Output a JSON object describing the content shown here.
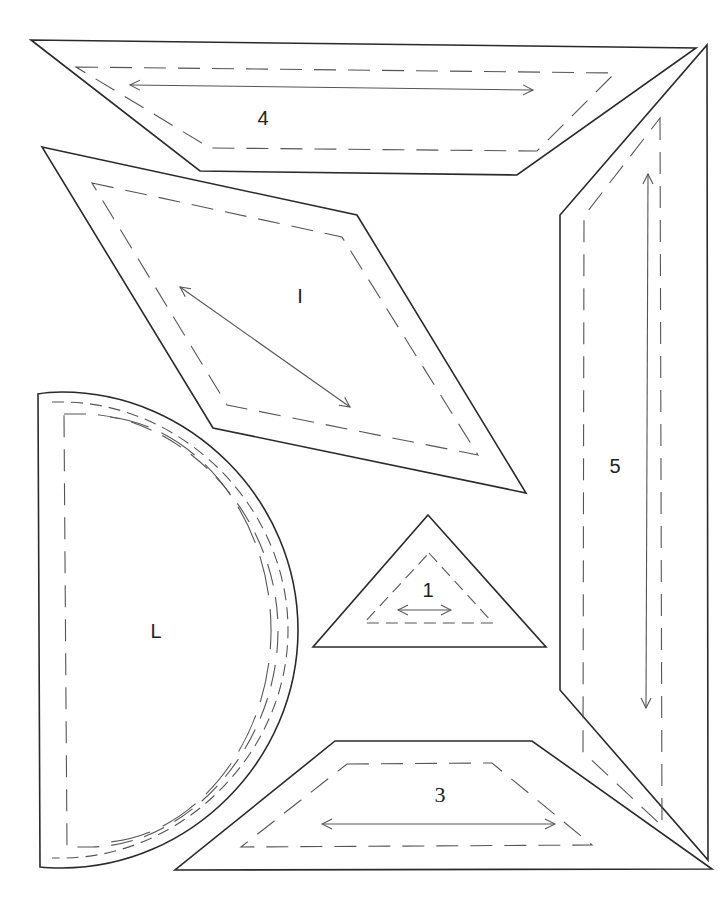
{
  "pieces": [
    {
      "id": "4",
      "label": "4",
      "shape": "trapezoid",
      "grain": "horizontal"
    },
    {
      "id": "I",
      "label": "I",
      "shape": "rhombus",
      "grain": "diagonal"
    },
    {
      "id": "5",
      "label": "5",
      "shape": "trapezoid-vertical",
      "grain": "vertical"
    },
    {
      "id": "L",
      "label": "L",
      "shape": "half-circle",
      "grain": "none"
    },
    {
      "id": "1",
      "label": "1",
      "shape": "triangle",
      "grain": "horizontal"
    },
    {
      "id": "3",
      "label": "3",
      "shape": "trapezoid",
      "grain": "horizontal"
    }
  ],
  "legend": {
    "solid_line": "cutting line",
    "dashed_line": "sewing line",
    "double_arrow": "grain line"
  },
  "colors": {
    "line": "#2a2a2a",
    "dashed": "#555555",
    "background": "#ffffff"
  }
}
